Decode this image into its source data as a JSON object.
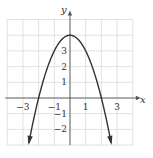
{
  "chart_data": {
    "type": "line",
    "title": "",
    "function": "y = 4 - x^2",
    "xlabel": "x",
    "ylabel": "y",
    "xlim": [
      -4,
      4
    ],
    "ylim": [
      -3,
      5
    ],
    "grid": true,
    "x_ticks": [
      "-3",
      "-1",
      "1",
      "3"
    ],
    "y_ticks": [
      "3",
      "2",
      "1",
      "-1",
      "-2"
    ],
    "x": [
      -2.7,
      -2,
      -1,
      0,
      1,
      2,
      2.7
    ],
    "values": [
      -3.29,
      0,
      3,
      4,
      3,
      0,
      -3.29
    ],
    "annotations": [
      "arrowheads at both ends of curve"
    ],
    "colors": {
      "curve": "#333333",
      "grid": "#cccccc",
      "axis": "#555555"
    }
  }
}
